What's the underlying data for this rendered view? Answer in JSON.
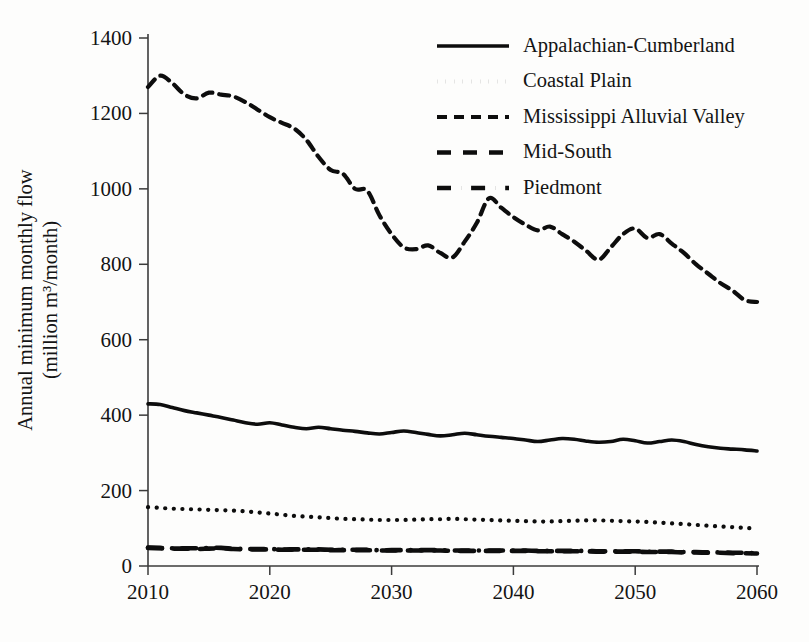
{
  "chart_data": {
    "type": "line",
    "title": "",
    "xlabel": "",
    "ylabel": "Annual minimum monthly flow (million m³/month)",
    "ylabel_line1": "Annual minimum monthly flow",
    "ylabel_line2": "(million m³/month)",
    "xlim": [
      2010,
      2060
    ],
    "ylim": [
      0,
      1400
    ],
    "xticks": [
      2010,
      2020,
      2030,
      2040,
      2050,
      2060
    ],
    "xtick_labels": [
      "2010",
      "2020",
      "2030",
      "2040",
      "2050",
      "2060"
    ],
    "yticks": [
      0,
      200,
      400,
      600,
      800,
      1000,
      1200,
      1400
    ],
    "ytick_labels": [
      "0",
      "200",
      "400",
      "600",
      "800",
      "1000",
      "1200",
      "1400"
    ],
    "grid": false,
    "legend_position": "top-right",
    "x": [
      2010,
      2011,
      2012,
      2013,
      2014,
      2015,
      2016,
      2017,
      2018,
      2019,
      2020,
      2021,
      2022,
      2023,
      2024,
      2025,
      2026,
      2027,
      2028,
      2029,
      2030,
      2031,
      2032,
      2033,
      2034,
      2035,
      2036,
      2037,
      2038,
      2039,
      2040,
      2041,
      2042,
      2043,
      2044,
      2045,
      2046,
      2047,
      2048,
      2049,
      2050,
      2051,
      2052,
      2053,
      2054,
      2055,
      2056,
      2057,
      2058,
      2059,
      2060
    ],
    "series": [
      {
        "name": "Appalachian-Cumberland",
        "linestyle": "solid",
        "color": "#0d0d0d",
        "values": [
          430,
          428,
          420,
          412,
          406,
          400,
          394,
          387,
          380,
          376,
          380,
          374,
          368,
          364,
          368,
          364,
          360,
          357,
          353,
          350,
          354,
          358,
          354,
          349,
          345,
          348,
          352,
          348,
          344,
          341,
          338,
          334,
          330,
          334,
          338,
          336,
          331,
          328,
          330,
          336,
          332,
          326,
          330,
          334,
          330,
          322,
          316,
          312,
          310,
          308,
          305
        ]
      },
      {
        "name": "Coastal Plain",
        "linestyle": "dotted",
        "color": "#0d0d0d",
        "values": [
          156,
          154,
          152,
          151,
          150,
          149,
          148,
          147,
          145,
          142,
          139,
          136,
          133,
          131,
          129,
          127,
          125,
          124,
          123,
          122,
          122,
          122,
          123,
          124,
          124,
          125,
          124,
          123,
          122,
          121,
          120,
          119,
          118,
          118,
          119,
          120,
          121,
          121,
          120,
          119,
          118,
          117,
          115,
          113,
          111,
          109,
          107,
          105,
          103,
          101,
          100
        ]
      },
      {
        "name": "Mississippi Alluvial Valley",
        "linestyle": "dashed",
        "color": "#0d0d0d",
        "values": [
          1270,
          1300,
          1280,
          1250,
          1240,
          1255,
          1250,
          1245,
          1230,
          1210,
          1190,
          1175,
          1160,
          1130,
          1085,
          1050,
          1040,
          1000,
          995,
          930,
          880,
          845,
          840,
          850,
          830,
          818,
          860,
          910,
          975,
          950,
          925,
          905,
          890,
          900,
          880,
          860,
          835,
          812,
          845,
          880,
          895,
          870,
          880,
          855,
          830,
          800,
          775,
          750,
          730,
          705,
          700
        ]
      },
      {
        "name": "Mid-South",
        "linestyle": "dashed-long",
        "color": "#0d0d0d",
        "values": [
          48,
          47,
          46,
          46,
          45,
          46,
          47,
          45,
          44,
          44,
          44,
          43,
          43,
          43,
          43,
          42,
          42,
          42,
          42,
          41,
          41,
          41,
          41,
          41,
          41,
          40,
          40,
          40,
          40,
          40,
          40,
          40,
          39,
          39,
          39,
          39,
          39,
          38,
          38,
          38,
          38,
          37,
          37,
          37,
          36,
          36,
          35,
          35,
          34,
          34,
          33
        ]
      },
      {
        "name": "Piedmont",
        "linestyle": "dash-dot",
        "color": "#0d0d0d",
        "values": [
          49,
          48,
          47,
          47,
          47,
          48,
          48,
          46,
          45,
          45,
          45,
          44,
          44,
          44,
          44,
          43,
          43,
          43,
          43,
          42,
          42,
          42,
          42,
          42,
          42,
          41,
          41,
          41,
          41,
          41,
          41,
          41,
          40,
          40,
          40,
          40,
          40,
          39,
          39,
          39,
          39,
          38,
          38,
          38,
          37,
          37,
          36,
          36,
          35,
          35,
          34
        ]
      }
    ]
  },
  "legend": {
    "items": [
      {
        "label": "Appalachian-Cumberland",
        "style": "solid"
      },
      {
        "label": "Coastal Plain",
        "style": "dotted"
      },
      {
        "label": "Mississippi Alluvial Valley",
        "style": "dashed"
      },
      {
        "label": "Mid-South",
        "style": "dashed-long"
      },
      {
        "label": "Piedmont",
        "style": "dash-dot"
      }
    ]
  }
}
